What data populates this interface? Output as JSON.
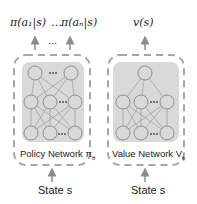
{
  "policy": {
    "outputs_left": "π(a₁|s)",
    "outputs_ellipsis": "…",
    "outputs_right": "π(aₙ|s)",
    "arrow_ellipsis": "…",
    "label": "Policy Network π",
    "label_sub": "θ",
    "input": "State s"
  },
  "value": {
    "output": "v(s)",
    "label": "Value Network V",
    "label_sub": "ϕ",
    "input": "State s"
  },
  "colors": {
    "box_fill": "#d9d9d9",
    "dashed_border": "#a6a6a6",
    "arrow": "#8c8c8c",
    "node_stroke": "#8f8f8f"
  }
}
